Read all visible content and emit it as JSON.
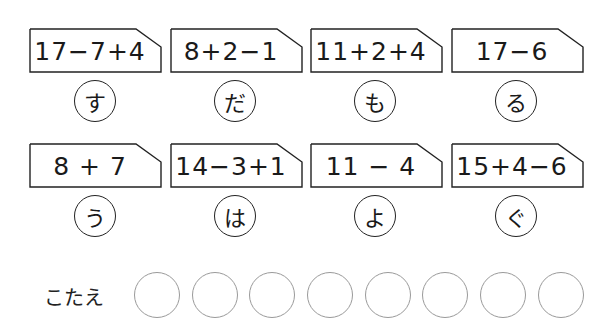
{
  "problems": [
    {
      "expression": "17−7+4",
      "kana": "す"
    },
    {
      "expression": "8+2−1",
      "kana": "だ"
    },
    {
      "expression": "11+2+4",
      "kana": "も"
    },
    {
      "expression": "17−6",
      "kana": "る"
    },
    {
      "expression": "8 + 7",
      "kana": "う"
    },
    {
      "expression": "14−3+1",
      "kana": "は"
    },
    {
      "expression": "11 − 4",
      "kana": "よ"
    },
    {
      "expression": "15+4−6",
      "kana": "ぐ"
    }
  ],
  "answer": {
    "label": "こたえ",
    "slot_count": 8
  },
  "colors": {
    "line": "#222222",
    "slot_border": "#9a9a9a"
  }
}
